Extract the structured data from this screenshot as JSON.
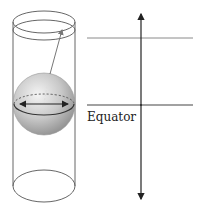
{
  "diagram": {
    "type": "cylinder-sphere-projection",
    "labels": {
      "equator": "Equator"
    },
    "colors": {
      "outline": "#555555",
      "light_line": "#8a8a8a",
      "dark_line": "#222222",
      "sphere_highlight": "#f2f2f2",
      "sphere_shadow": "#9a9a9a"
    },
    "elements": [
      "cylinder",
      "sphere",
      "equator-arrow",
      "projection-arrow",
      "latitude-line",
      "equator-line",
      "vertical-axis-arrow"
    ]
  }
}
